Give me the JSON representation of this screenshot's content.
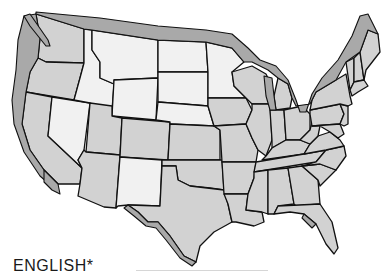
{
  "map": {
    "subject": "Contiguous United States",
    "legend_label": "ENGLISH*",
    "shades": {
      "dark": "#a9a9a9",
      "medium": "#d2d2d2",
      "light": "#f1f1f1",
      "outline": "#111111",
      "background": "#ffffff"
    },
    "regions": [
      {
        "name": "Washington",
        "shade": "medium"
      },
      {
        "name": "Oregon",
        "shade": "medium"
      },
      {
        "name": "California",
        "shade": "medium"
      },
      {
        "name": "Idaho",
        "shade": "light"
      },
      {
        "name": "Nevada",
        "shade": "light"
      },
      {
        "name": "Montana",
        "shade": "light"
      },
      {
        "name": "Wyoming",
        "shade": "light"
      },
      {
        "name": "Utah",
        "shade": "medium"
      },
      {
        "name": "Arizona",
        "shade": "medium"
      },
      {
        "name": "Colorado",
        "shade": "medium"
      },
      {
        "name": "New Mexico",
        "shade": "light"
      },
      {
        "name": "North Dakota",
        "shade": "light"
      },
      {
        "name": "South Dakota",
        "shade": "light"
      },
      {
        "name": "Nebraska",
        "shade": "light"
      },
      {
        "name": "Kansas",
        "shade": "medium"
      },
      {
        "name": "Oklahoma",
        "shade": "medium"
      },
      {
        "name": "Texas",
        "shade": "medium"
      },
      {
        "name": "Minnesota",
        "shade": "light"
      },
      {
        "name": "Iowa",
        "shade": "medium"
      },
      {
        "name": "Missouri",
        "shade": "medium"
      },
      {
        "name": "Arkansas",
        "shade": "medium"
      },
      {
        "name": "Louisiana",
        "shade": "medium"
      },
      {
        "name": "Wisconsin",
        "shade": "medium"
      },
      {
        "name": "Illinois",
        "shade": "medium"
      },
      {
        "name": "Michigan",
        "shade": "medium"
      },
      {
        "name": "Indiana",
        "shade": "medium"
      },
      {
        "name": "Ohio",
        "shade": "medium"
      },
      {
        "name": "Kentucky",
        "shade": "medium"
      },
      {
        "name": "Tennessee",
        "shade": "medium"
      },
      {
        "name": "Mississippi",
        "shade": "medium"
      },
      {
        "name": "Alabama",
        "shade": "medium"
      },
      {
        "name": "Georgia",
        "shade": "medium"
      },
      {
        "name": "Florida",
        "shade": "medium"
      },
      {
        "name": "South Carolina",
        "shade": "medium"
      },
      {
        "name": "North Carolina",
        "shade": "medium"
      },
      {
        "name": "Virginia",
        "shade": "medium"
      },
      {
        "name": "West Virginia",
        "shade": "medium"
      },
      {
        "name": "Pennsylvania",
        "shade": "medium"
      },
      {
        "name": "New York",
        "shade": "medium"
      },
      {
        "name": "Vermont",
        "shade": "medium"
      },
      {
        "name": "New Hampshire",
        "shade": "medium"
      },
      {
        "name": "Maine",
        "shade": "medium"
      },
      {
        "name": "Massachusetts",
        "shade": "medium"
      },
      {
        "name": "Maryland",
        "shade": "medium"
      },
      {
        "name": "New Jersey",
        "shade": "medium"
      }
    ],
    "border_bands": [
      {
        "name": "Pacific coast band",
        "shade": "dark"
      },
      {
        "name": "Northern border band",
        "shade": "dark"
      },
      {
        "name": "Great Lakes / St. Lawrence band",
        "shade": "dark"
      },
      {
        "name": "Mexican border band",
        "shade": "dark"
      },
      {
        "name": "Gulf coast Florida band",
        "shade": "dark"
      }
    ]
  }
}
